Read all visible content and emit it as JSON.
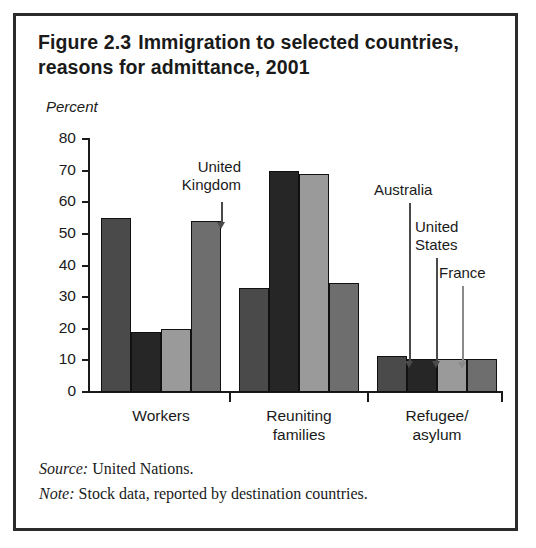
{
  "figure": {
    "title_line1": "Figure 2.3",
    "title_line2": "Immigration to selected",
    "title_line3": "countries, reasons for admittance, 2001",
    "axis_note": "Percent"
  },
  "footer": {
    "source_label": "Source:",
    "source_text": "United Nations.",
    "note_label": "Note:",
    "note_text": "Stock data, reported by destination countries."
  },
  "callouts": [
    {
      "name": "united-kingdom",
      "line1": "United",
      "line2": "Kingdom"
    },
    {
      "name": "australia",
      "line1": "Australia",
      "line2": ""
    },
    {
      "name": "united-states",
      "line1": "United",
      "line2": "States"
    },
    {
      "name": "france",
      "line1": "France",
      "line2": ""
    }
  ],
  "colors": {
    "series_australia": "#4a4a4a",
    "series_united_states": "#262626",
    "series_france": "#9a9a9a",
    "series_united_kingdom": "#6e6e6e",
    "frame": "#2b2b2b",
    "axis": "#1a1a1a"
  },
  "chart_data": {
    "type": "bar",
    "xlabel": "",
    "ylabel": "Percent",
    "ylim": [
      0,
      80
    ],
    "yticks": [
      0,
      10,
      20,
      30,
      40,
      50,
      60,
      70,
      80
    ],
    "ytick_labels": [
      "0",
      "10",
      "20",
      "30",
      "40",
      "50",
      "60",
      "70",
      "80"
    ],
    "grid": false,
    "legend": "arrow-callouts",
    "categories": [
      "Workers",
      "Reuniting families",
      "Refugee/ asylum"
    ],
    "category_labels": [
      {
        "line1": "Workers",
        "line2": ""
      },
      {
        "line1": "Reuniting",
        "line2": "families"
      },
      {
        "line1": "Refugee/",
        "line2": "asylum"
      }
    ],
    "series": [
      {
        "name": "Australia",
        "color": "#4a4a4a",
        "values": [
          55,
          33,
          11.5
        ]
      },
      {
        "name": "United States",
        "color": "#262626",
        "values": [
          19,
          70,
          10.5
        ]
      },
      {
        "name": "France",
        "color": "#9a9a9a",
        "values": [
          20,
          69,
          10.5
        ]
      },
      {
        "name": "United Kingdom",
        "color": "#6e6e6e",
        "values": [
          54,
          34.5,
          10.5
        ]
      }
    ]
  }
}
